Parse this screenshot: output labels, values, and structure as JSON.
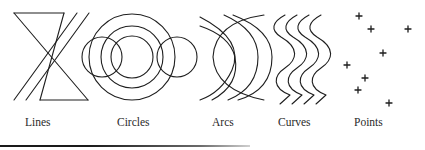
{
  "figure": {
    "stroke_color": "#1e1e1e",
    "panels": [
      {
        "id": "lines",
        "label": "Lines",
        "label_x": 25
      },
      {
        "id": "circles",
        "label": "Circles",
        "label_x": 117
      },
      {
        "id": "arcs",
        "label": "Arcs",
        "label_x": 212
      },
      {
        "id": "curves",
        "label": "Curves",
        "label_x": 278
      },
      {
        "id": "points",
        "label": "Points",
        "label_x": 354
      }
    ],
    "points": [
      [
        359,
        16
      ],
      [
        371,
        29
      ],
      [
        408,
        29
      ],
      [
        383,
        53
      ],
      [
        347,
        65
      ],
      [
        365,
        78
      ],
      [
        358,
        90
      ],
      [
        389,
        103
      ]
    ],
    "point_glyph": "+"
  }
}
